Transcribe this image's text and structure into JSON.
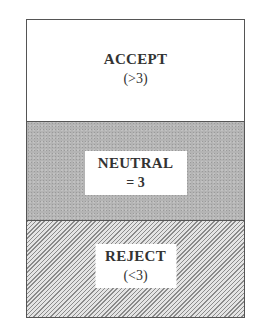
{
  "diagram": {
    "sections": [
      {
        "title": "ACCEPT",
        "condition": "(>3)",
        "fill": "#ffffff"
      },
      {
        "title": "NEUTRAL",
        "condition": "= 3",
        "fill": "#b4b4b4"
      },
      {
        "title": "REJECT",
        "condition": "(<3)",
        "fill": "hatched"
      }
    ],
    "colors": {
      "border": "#555555",
      "text": "#333333"
    }
  }
}
